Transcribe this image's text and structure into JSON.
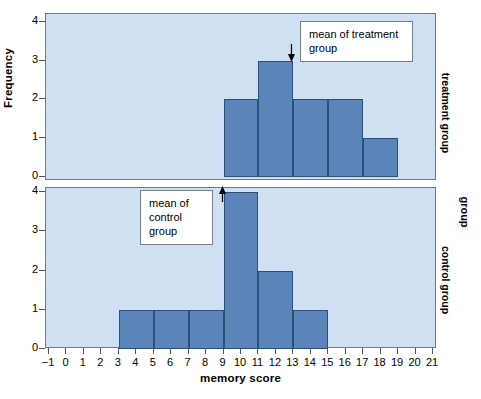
{
  "chart_data": {
    "type": "bar",
    "title": "",
    "xlabel": "memory score",
    "ylabel": "Frequency",
    "grid": false,
    "legend": "none",
    "xlim": [
      -1,
      21
    ],
    "ylim": [
      0,
      4
    ],
    "x_ticks": [
      "−1",
      "0",
      "1",
      "2",
      "3",
      "4",
      "5",
      "6",
      "7",
      "8",
      "9",
      "10",
      "11",
      "12",
      "13",
      "14",
      "15",
      "16",
      "17",
      "18",
      "19",
      "20",
      "21"
    ],
    "y_ticks": [
      "0",
      "1",
      "2",
      "3",
      "4"
    ],
    "bin_width": 2,
    "facet_axis_label": "group",
    "panels": [
      {
        "id": "treatment",
        "strip_label": "treatment group",
        "bins": [
          {
            "start": 9,
            "end": 11,
            "frequency": 2
          },
          {
            "start": 11,
            "end": 13,
            "frequency": 3
          },
          {
            "start": 13,
            "end": 15,
            "frequency": 2
          },
          {
            "start": 15,
            "end": 17,
            "frequency": 2
          },
          {
            "start": 17,
            "end": 19,
            "frequency": 1
          }
        ],
        "annotation": {
          "text": "mean of treatment group",
          "mean_x": 13.0,
          "arrow_direction": "down"
        }
      },
      {
        "id": "control",
        "strip_label": "control group",
        "bins": [
          {
            "start": 3,
            "end": 5,
            "frequency": 1
          },
          {
            "start": 5,
            "end": 7,
            "frequency": 1
          },
          {
            "start": 7,
            "end": 9,
            "frequency": 1
          },
          {
            "start": 9,
            "end": 11,
            "frequency": 4
          },
          {
            "start": 11,
            "end": 13,
            "frequency": 2
          },
          {
            "start": 13,
            "end": 15,
            "frequency": 1
          }
        ],
        "annotation": {
          "text": "mean of control group",
          "mean_x": 9.0,
          "arrow_direction": "up"
        }
      }
    ],
    "colors": {
      "bar_fill": "#5b84b8",
      "bar_edge": "#2d4f7c",
      "panel_background": "#cfe0f2",
      "panel_border": "#6a7a8c",
      "figure_background": "#ffffff",
      "text": "#000000",
      "callout_background": "#ffffff",
      "callout_border": "#777f8a"
    }
  }
}
